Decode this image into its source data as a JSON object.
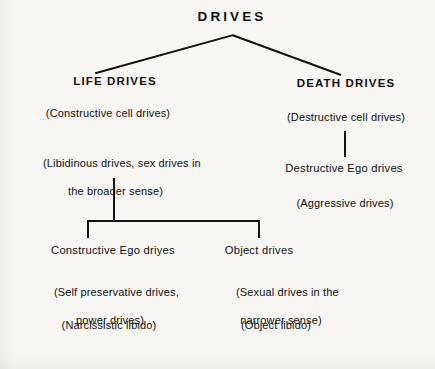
{
  "diagram": {
    "type": "tree",
    "title": "DRIVES",
    "root": {
      "id": "drives",
      "label": "DRIVES"
    },
    "branches": [
      {
        "id": "life-drives",
        "label": "LIFE DRIVES",
        "glosses": [
          {
            "id": "constructive-cell-drives",
            "text": "(Constructive cell drives)"
          },
          {
            "id": "libidinous-drives",
            "line1": "(Libidinous drives, sex drives in",
            "line2": "the broader sense)"
          }
        ],
        "children": [
          {
            "id": "constructive-ego-drives",
            "label": "Constructive Ego driyes",
            "glosses": [
              {
                "id": "self-preservative-drives",
                "line1": "(Self preservative drives,",
                "line2": "power drives)"
              },
              {
                "id": "narcissistic-libido",
                "text": "(Narcissistic libido)"
              }
            ]
          },
          {
            "id": "object-drives",
            "label": "Object drives",
            "glosses": [
              {
                "id": "sexual-drives-narrower",
                "line1": "(Sexual drives in the",
                "line2": "narrower sense)"
              },
              {
                "id": "object-libido",
                "text": "(Object libido)"
              }
            ]
          }
        ]
      },
      {
        "id": "death-drives",
        "label": "DEATH DRIVES",
        "glosses": [
          {
            "id": "destructive-cell-drives",
            "text": "(Destructive cell drives)"
          }
        ],
        "children": [
          {
            "id": "destructive-ego-drives",
            "label": "Destructive Ego drives",
            "glosses": [
              {
                "id": "aggressive-drives",
                "text": "(Aggressive drives)"
              }
            ]
          }
        ]
      }
    ],
    "colors": {
      "background": "#f7f6f3",
      "ink": "#121212"
    }
  }
}
